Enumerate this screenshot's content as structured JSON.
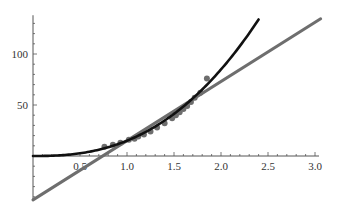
{
  "chart_data": {
    "type": "scatter",
    "title": "",
    "xlabel": "",
    "ylabel": "",
    "xlim": [
      0,
      3.0
    ],
    "ylim": [
      -43,
      138
    ],
    "grid": false,
    "legend": null,
    "x_ticks": [
      "0.5",
      "1.0",
      "1.5",
      "2.0",
      "2.5",
      "3.0"
    ],
    "y_ticks": [
      "50",
      "100"
    ],
    "series": [
      {
        "name": "data points",
        "kind": "scatter",
        "color": "#6e6e6e",
        "points": [
          [
            0.76,
            9
          ],
          [
            0.85,
            11
          ],
          [
            0.93,
            13
          ],
          [
            1.02,
            16
          ],
          [
            1.08,
            17
          ],
          [
            1.12,
            19
          ],
          [
            1.18,
            21
          ],
          [
            1.25,
            24
          ],
          [
            1.32,
            28
          ],
          [
            1.4,
            32
          ],
          [
            1.48,
            37
          ],
          [
            1.52,
            40
          ],
          [
            1.56,
            43
          ],
          [
            1.6,
            46
          ],
          [
            1.64,
            49
          ],
          [
            1.68,
            53
          ],
          [
            1.72,
            57
          ],
          [
            1.78,
            62
          ],
          [
            1.85,
            76
          ]
        ]
      },
      {
        "name": "power-law fit",
        "kind": "line",
        "color": "#111111",
        "formula": "y = 15 x^2.5",
        "x_range": [
          0,
          2.4
        ]
      },
      {
        "name": "linear fit",
        "kind": "line",
        "color": "#6e6e6e",
        "formula": "y = 58 x - 43",
        "x_range": [
          0,
          3.06
        ]
      }
    ]
  },
  "layout": {
    "origin_px": [
      33,
      156
    ],
    "x_px_per_unit": 94,
    "y_px_per_unit": 1.02
  }
}
